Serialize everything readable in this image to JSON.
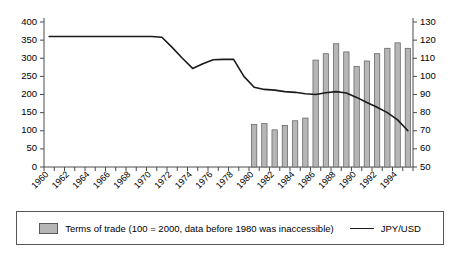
{
  "chart_data": {
    "type": "bar",
    "title": "",
    "xlabel": "",
    "ylabel": "",
    "grid": false,
    "legend_position": "bottom",
    "x": [
      1960,
      1961,
      1962,
      1963,
      1964,
      1965,
      1966,
      1967,
      1968,
      1969,
      1970,
      1971,
      1972,
      1973,
      1974,
      1975,
      1976,
      1977,
      1978,
      1979,
      1980,
      1981,
      1982,
      1983,
      1984,
      1985,
      1986,
      1987,
      1988,
      1989,
      1990,
      1991,
      1992,
      1993,
      1994,
      1995
    ],
    "xtick_labels": [
      "1960",
      "1962",
      "1964",
      "1966",
      "1968",
      "1970",
      "1972",
      "1974",
      "1976",
      "1978",
      "1980",
      "1982",
      "1984",
      "1986",
      "1988",
      "1990",
      "1992",
      "1994"
    ],
    "axes": {
      "left": {
        "label": "",
        "ylim": [
          0,
          400
        ],
        "ticks": [
          0,
          50,
          100,
          150,
          200,
          250,
          300,
          350,
          400
        ]
      },
      "right": {
        "label": "",
        "ylim": [
          50,
          130
        ],
        "ticks": [
          50,
          60,
          70,
          80,
          90,
          100,
          110,
          120,
          130
        ]
      }
    },
    "series": [
      {
        "name": "Terms of trade (100 = 2000, data before 1980 was inaccessible)",
        "type": "bar",
        "axis": "right",
        "color": "#b6b6b6",
        "edge_color": "#5a5a5a",
        "values": [
          null,
          null,
          null,
          null,
          null,
          null,
          null,
          null,
          null,
          null,
          null,
          null,
          null,
          null,
          null,
          null,
          null,
          null,
          null,
          null,
          73.5,
          74.0,
          70.5,
          73.0,
          75.5,
          77.0,
          109.0,
          112.5,
          118.0,
          113.5,
          105.5,
          108.5,
          112.5,
          115.5,
          118.5,
          115.5
        ]
      },
      {
        "name": "JPY/USD",
        "type": "line",
        "axis": "left",
        "color": "#1a1a1a",
        "values": [
          360,
          360,
          360,
          360,
          360,
          360,
          360,
          360,
          360,
          360,
          360,
          358,
          330,
          300,
          272,
          285,
          296,
          297,
          297,
          250,
          220,
          214,
          212,
          208,
          206,
          202,
          200,
          205,
          208,
          204,
          192,
          178,
          165,
          150,
          130,
          100
        ]
      }
    ]
  },
  "legend": {
    "entries": [
      {
        "icon": "bar-swatch",
        "label": "Terms of trade (100 = 2000, data before 1980 was inaccessible)"
      },
      {
        "icon": "line-swatch",
        "label": "JPY/USD"
      }
    ]
  }
}
